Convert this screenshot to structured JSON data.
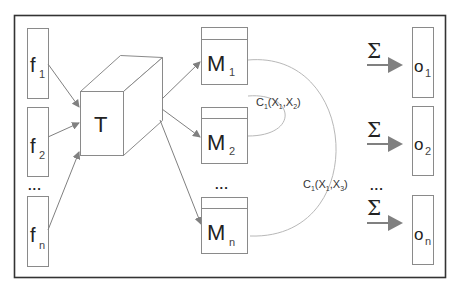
{
  "inputs": [
    {
      "label": "f",
      "sub": "1"
    },
    {
      "label": "f",
      "sub": "2"
    },
    {
      "label": "f",
      "sub": "n"
    }
  ],
  "inputs_ellipsis": "...",
  "tensor": {
    "label": "T"
  },
  "models": [
    {
      "label": "M",
      "sub": "1"
    },
    {
      "label": "M",
      "sub": "2"
    },
    {
      "label": "M",
      "sub": "n"
    }
  ],
  "models_ellipsis": "...",
  "correlations": [
    {
      "prefix": "C",
      "p_sub": "1",
      "open": "(X",
      "a_sub": "1",
      "mid": ",X",
      "b_sub": "2",
      "close": ")"
    },
    {
      "prefix": "C",
      "p_sub": "1",
      "open": "(X",
      "a_sub": "1",
      "mid": ",X",
      "b_sub": "3",
      "close": ")"
    }
  ],
  "sum_symbol": "Σ",
  "outputs": [
    {
      "label": "o",
      "sub": "1"
    },
    {
      "label": "o",
      "sub": "2"
    },
    {
      "label": "o",
      "sub": "n"
    }
  ],
  "outputs_ellipsis": "...",
  "colors": {
    "frame": "#333333",
    "box": "#8a8a8a",
    "arrow": "#808080",
    "arc": "#b8b8b8"
  }
}
